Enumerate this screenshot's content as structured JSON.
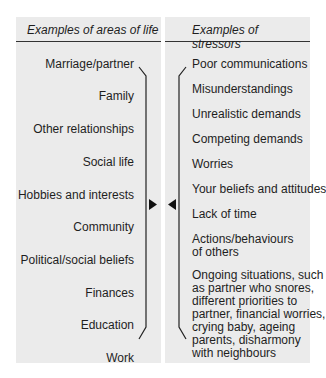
{
  "left_column": {
    "header": "Examples of areas of life",
    "items": [
      "Marriage/partner",
      "Family",
      "Other relationships",
      "Social life",
      "Hobbies and interests",
      "Community",
      "Political/social beliefs",
      "Finances",
      "Education",
      "Work"
    ]
  },
  "right_column": {
    "header": "Examples of stressors",
    "items": [
      "Poor communications",
      "Misunderstandings",
      "Unrealistic demands",
      "Competing demands",
      "Worries",
      "Your beliefs and attitudes",
      "Lack of time",
      "Actions/behaviours",
      "of others",
      "Ongoing situations, such",
      "as partner who snores,",
      "different priorities to",
      "partner, financial worries,",
      "crying baby, ageing",
      "parents, disharmony",
      "with neighbours"
    ]
  },
  "connector": {
    "left_arrow_icon": "triangle-right",
    "right_arrow_icon": "triangle-left",
    "color": "#111111"
  }
}
